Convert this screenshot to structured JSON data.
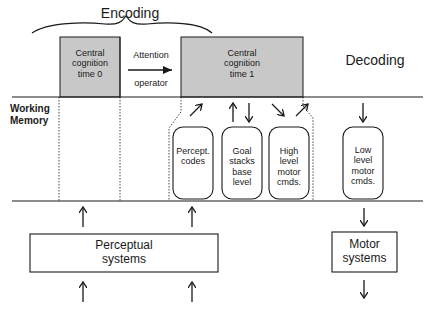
{
  "header": {
    "encoding_label": "Encoding",
    "decoding_label": "Decoding"
  },
  "central_cognition": [
    {
      "lines": [
        "Central",
        "cognition",
        "time 0"
      ]
    },
    {
      "lines": [
        "Central",
        "cognition",
        "time 1"
      ]
    }
  ],
  "attention": {
    "top_label": "Attention",
    "bottom_label": "operator"
  },
  "working_memory": {
    "label_line1": "Working",
    "label_line2": "Memory",
    "buffers": [
      {
        "lines": [
          "Percept.",
          "codes"
        ]
      },
      {
        "lines": [
          "Goal",
          "stacks",
          "base",
          "level"
        ]
      },
      {
        "lines": [
          "High",
          "level",
          "motor",
          "cmds."
        ]
      },
      {
        "lines": [
          "Low",
          "level",
          "motor",
          "cmds."
        ]
      }
    ]
  },
  "systems": {
    "perceptual": [
      "Perceptual",
      "systems"
    ],
    "motor": [
      "Motor",
      "systems"
    ]
  },
  "colors": {
    "gray_fill": "#c8c8c8",
    "line": "#1a1a1a"
  }
}
